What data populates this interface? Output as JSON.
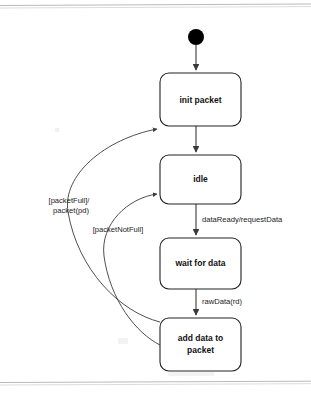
{
  "diagram": {
    "kind": "uml-state-diagram",
    "title": "",
    "page": {
      "width": 311,
      "height": 395,
      "background": "#ffffff",
      "line_color": "#3a3a3a",
      "box_stroke": "#222222",
      "text_color": "#111111"
    },
    "start_node": {
      "name": "initial-pseudostate",
      "cx": 196,
      "cy": 37,
      "r": 8
    },
    "states": [
      {
        "id": "init-packet",
        "label": "init packet",
        "lines": [
          "init packet"
        ],
        "x": 160,
        "y": 73,
        "width": 81,
        "height": 53,
        "rx": 9
      },
      {
        "id": "idle",
        "label": "idle",
        "lines": [
          "idle"
        ],
        "x": 160,
        "y": 155,
        "width": 81,
        "height": 49,
        "rx": 9
      },
      {
        "id": "wait-for-data",
        "label": "wait for data",
        "lines": [
          "wait for data"
        ],
        "x": 160,
        "y": 238,
        "width": 81,
        "height": 51,
        "rx": 9
      },
      {
        "id": "add-data-to-packet",
        "label": "add data to packet",
        "lines": [
          "add data to",
          "packet"
        ],
        "x": 160,
        "y": 318,
        "width": 81,
        "height": 53,
        "rx": 9
      }
    ],
    "transitions": [
      {
        "id": "start-to-init",
        "from": "initial-pseudostate",
        "to": "init-packet",
        "label": "",
        "kind": "straight"
      },
      {
        "id": "init-to-idle",
        "from": "init-packet",
        "to": "idle",
        "label": "",
        "kind": "straight"
      },
      {
        "id": "idle-to-wait",
        "from": "idle",
        "to": "wait-for-data",
        "label": "dataReady/requestData",
        "label_x": 200,
        "label_y": 220,
        "kind": "straight"
      },
      {
        "id": "wait-to-add",
        "from": "wait-for-data",
        "to": "add-data-to-packet",
        "label": "rawData(rd)",
        "label_x": 200,
        "label_y": 302,
        "kind": "straight"
      },
      {
        "id": "add-to-init",
        "from": "add-data-to-packet",
        "to": "init-packet",
        "label": "[packetFull]/\npacket(pd)",
        "label_lines": [
          "[packetFull]/",
          "packet(pd)"
        ],
        "label_x": 68,
        "label_y": 201,
        "kind": "curve"
      },
      {
        "id": "add-to-idle",
        "from": "add-data-to-packet",
        "to": "idle",
        "label": "[packetNotFull]",
        "label_lines": [
          "[packetNotFull]"
        ],
        "label_x": 86,
        "label_y": 230,
        "kind": "curve"
      }
    ]
  }
}
